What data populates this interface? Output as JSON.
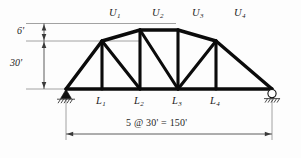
{
  "figure": {
    "kind": "structural-truss-elevation",
    "truss_type": "camelback-parker-truss"
  },
  "top_nodes": [
    {
      "id": "U1",
      "label": "U",
      "sub": "1"
    },
    {
      "id": "U2",
      "label": "U",
      "sub": "2"
    },
    {
      "id": "U3",
      "label": "U",
      "sub": "3"
    },
    {
      "id": "U4",
      "label": "U",
      "sub": "4"
    }
  ],
  "bottom_nodes": [
    {
      "id": "L1",
      "label": "L",
      "sub": "1"
    },
    {
      "id": "L2",
      "label": "L",
      "sub": "2"
    },
    {
      "id": "L3",
      "label": "L",
      "sub": "3"
    },
    {
      "id": "L4",
      "label": "L",
      "sub": "4"
    }
  ],
  "dimensions": {
    "rise": "6'",
    "height": "30'",
    "span": "5 @ 30' = 150'"
  },
  "supports": {
    "left": "pin-support",
    "right": "roller-support"
  },
  "colors": {
    "member": "#0b0b0b",
    "dimension": "#4a4a4a",
    "extension": "#8a8a8a",
    "background": "#fdfdfd",
    "text": "#1a1a1a"
  }
}
